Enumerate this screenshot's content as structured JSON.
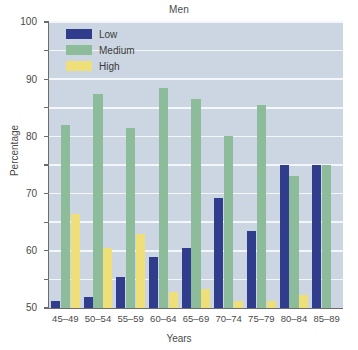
{
  "chart_data": {
    "type": "bar",
    "title": "Men",
    "xlabel": "Years",
    "ylabel": "Percentage",
    "ylim": [
      0,
      100
    ],
    "ytick_step": 10,
    "yticks": [
      0,
      10,
      20,
      30,
      40,
      50,
      60,
      70,
      80,
      90,
      100
    ],
    "grid": true,
    "legend_position": "top-left-inside",
    "categories": [
      "45–49",
      "50–54",
      "55–59",
      "60–64",
      "65–69",
      "70–74",
      "75–79",
      "80–84",
      "85–89"
    ],
    "series": [
      {
        "name": "Low",
        "color": "#2f3d8c",
        "values": [
          2.5,
          4,
          11,
          18,
          21,
          38.5,
          27,
          50,
          50
        ]
      },
      {
        "name": "Medium",
        "color": "#8cbc9a",
        "values": [
          64,
          75,
          63,
          77,
          73,
          60,
          71,
          46,
          50
        ]
      },
      {
        "name": "High",
        "color": "#efdf78",
        "values": [
          33,
          21,
          26,
          5.5,
          6.5,
          2.5,
          2.5,
          4.5,
          0
        ]
      }
    ],
    "plot_background": "#ccd6e2",
    "gridline_color": "#f4f7fa",
    "axis_color": "#6c6c6c"
  }
}
